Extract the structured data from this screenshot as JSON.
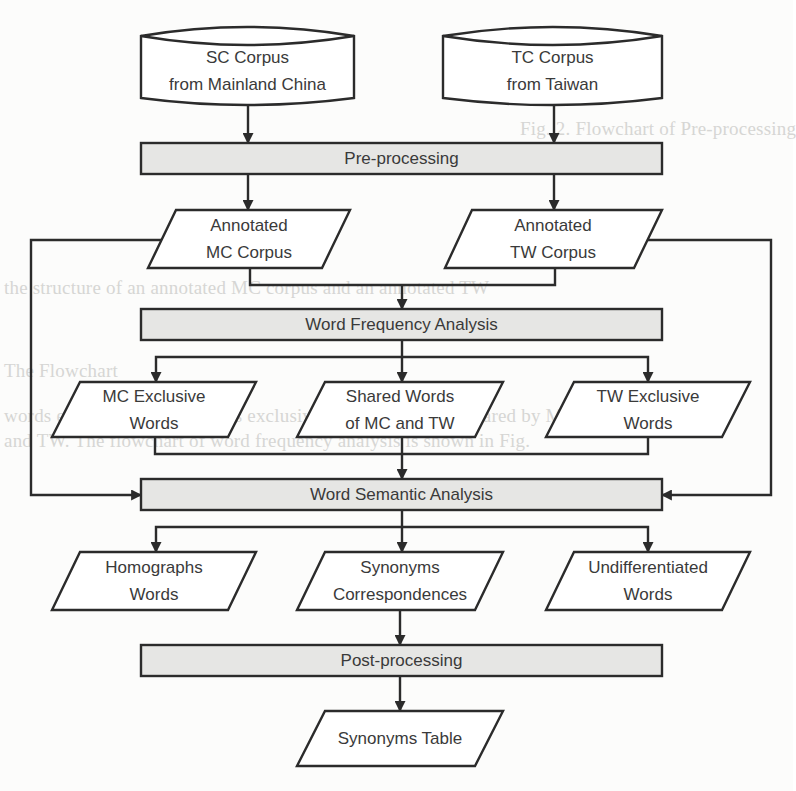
{
  "diagram": {
    "colors": {
      "stroke": "#2b2b2b",
      "process_fill": "#e6e6e4",
      "shape_fill": "#ffffff",
      "text": "#3a3a3a",
      "background": "#fcfcfb"
    },
    "sources": [
      {
        "id": "sc_corpus",
        "shape": "cylinder",
        "line1": "SC Corpus",
        "line2": "from Mainland China"
      },
      {
        "id": "tc_corpus",
        "shape": "cylinder",
        "line1": "TC Corpus",
        "line2": "from Taiwan"
      }
    ],
    "processes": [
      {
        "id": "pre_processing",
        "shape": "rectangle",
        "label": "Pre-processing"
      },
      {
        "id": "word_frequency_analysis",
        "shape": "rectangle",
        "label": "Word Frequency Analysis"
      },
      {
        "id": "word_semantic_analysis",
        "shape": "rectangle",
        "label": "Word Semantic Analysis"
      },
      {
        "id": "post_processing",
        "shape": "rectangle",
        "label": "Post-processing"
      }
    ],
    "data_nodes": {
      "annotated_mc": {
        "shape": "parallelogram",
        "line1": "Annotated",
        "line2": "MC Corpus"
      },
      "annotated_tw": {
        "shape": "parallelogram",
        "line1": "Annotated",
        "line2": "TW Corpus"
      },
      "mc_exclusive": {
        "shape": "parallelogram",
        "line1": "MC Exclusive",
        "line2": "Words"
      },
      "shared_words": {
        "shape": "parallelogram",
        "line1": "Shared Words",
        "line2": "of MC and TW"
      },
      "tw_exclusive": {
        "shape": "parallelogram",
        "line1": "TW Exclusive",
        "line2": "Words"
      },
      "homographs": {
        "shape": "parallelogram",
        "line1": "Homographs",
        "line2": "Words"
      },
      "synonyms_corr": {
        "shape": "parallelogram",
        "line1": "Synonyms",
        "line2": "Correspondences"
      },
      "undifferentiated": {
        "shape": "parallelogram",
        "line1": "Undifferentiated",
        "line2": "Words"
      },
      "synonyms_table": {
        "shape": "parallelogram",
        "line1": "Synonyms Table"
      }
    },
    "edges": [
      {
        "from": "SC Corpus from Mainland China",
        "to": "Pre-processing"
      },
      {
        "from": "TC Corpus from Taiwan",
        "to": "Pre-processing"
      },
      {
        "from": "Pre-processing",
        "to": "Annotated MC Corpus"
      },
      {
        "from": "Pre-processing",
        "to": "Annotated TW Corpus"
      },
      {
        "from": "Annotated MC Corpus",
        "to": "Word Frequency Analysis"
      },
      {
        "from": "Annotated TW Corpus",
        "to": "Word Frequency Analysis"
      },
      {
        "from": "Annotated MC Corpus",
        "to": "Word Semantic Analysis",
        "route": "left loop"
      },
      {
        "from": "Annotated TW Corpus",
        "to": "Word Semantic Analysis",
        "route": "right loop"
      },
      {
        "from": "Word Frequency Analysis",
        "to": "MC Exclusive Words"
      },
      {
        "from": "Word Frequency Analysis",
        "to": "Shared Words of MC and TW"
      },
      {
        "from": "Word Frequency Analysis",
        "to": "TW Exclusive Words"
      },
      {
        "from": "MC Exclusive Words",
        "to": "Word Semantic Analysis"
      },
      {
        "from": "Shared Words of MC and TW",
        "to": "Word Semantic Analysis"
      },
      {
        "from": "TW Exclusive Words",
        "to": "Word Semantic Analysis"
      },
      {
        "from": "Word Semantic Analysis",
        "to": "Homographs Words"
      },
      {
        "from": "Word Semantic Analysis",
        "to": "Synonyms Correspondences"
      },
      {
        "from": "Word Semantic Analysis",
        "to": "Undifferentiated Words"
      },
      {
        "from": "Synonyms Correspondences",
        "to": "Post-processing"
      },
      {
        "from": "Post-processing",
        "to": "Synonyms Table"
      }
    ]
  },
  "background_bleed": {
    "lines": [
      "Fig. 2. Flowchart of Pre-processing",
      "the structure of an annotated MC corpus and an annotated TW",
      "The Flowchart",
      "words exclusive to MC, words exclusive to TW and words shared by MC",
      "and TW. The flowchart of word frequency analysis is shown in Fig."
    ]
  }
}
